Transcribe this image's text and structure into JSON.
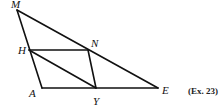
{
  "caption": "(Ex. 23)",
  "points": {
    "M": {
      "label": "M",
      "x": 17,
      "y": 10
    },
    "H": {
      "label": "H",
      "x": 29,
      "y": 50
    },
    "N": {
      "label": "N",
      "x": 88,
      "y": 50
    },
    "A": {
      "label": "A",
      "x": 42,
      "y": 88
    },
    "Y": {
      "label": "Y",
      "x": 96,
      "y": 88
    },
    "E": {
      "label": "E",
      "x": 158,
      "y": 88
    }
  },
  "segments": [
    [
      "M",
      "A"
    ],
    [
      "M",
      "E"
    ],
    [
      "A",
      "E"
    ],
    [
      "H",
      "N"
    ],
    [
      "H",
      "Y"
    ],
    [
      "N",
      "Y"
    ]
  ],
  "line_color": "#111111"
}
